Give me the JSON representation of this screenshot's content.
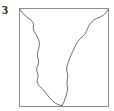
{
  "panel": {
    "label": "3",
    "label_icon": "panel-number-label",
    "background_color": "#ffffff"
  },
  "frame": {
    "name": "plot-frame-rectangle",
    "stroke_color": "#8c8c8c",
    "stroke_width": 1,
    "x": 19.5,
    "y": 8.5,
    "width": 89,
    "height": 98
  },
  "contour": {
    "name": "traced-outline-shape",
    "description": "hand-traced closed contour spanning the frame, open at the top edge, tapering to a rounded point near bottom-center",
    "stroke_color": "#6e6e6e",
    "stroke_width": 1,
    "fill": "none",
    "left_branch_path": "M 19.8 9.2 L 22.5 13.0 L 25.5 16.0 L 28.6 18.2 L 31.2 20.2 L 33.0 22.4 L 33.6 24.8 L 33.2 27.6 L 33.8 30.6 L 35.4 33.6 L 37.2 36.6 L 38.6 39.8 L 39.4 43.2 L 39.2 46.4 L 38.4 49.4 L 37.6 52.4 L 37.4 55.4 L 38.0 58.2 L 38.6 61.0 L 38.4 63.8 L 37.4 66.4 L 36.6 69.0 L 36.8 71.6 L 37.8 74.0 L 38.2 76.4 L 37.6 78.8 L 37.0 81.2 L 37.6 83.6 L 39.2 85.8 L 41.4 88.0 L 43.6 90.2 L 45.6 92.6 L 47.6 95.2 L 49.8 98.0 L 52.4 100.8 L 55.4 103.2 L 58.8 104.9 L 62.2 105.6",
    "right_branch_path": "M 108.4 9.2 L 106.2 12.6 L 103.4 15.2 L 100.2 17.0 L 96.8 18.4 L 93.6 20.2 L 91.0 22.6 L 89.0 25.4 L 87.6 28.4 L 86.4 31.4 L 84.8 34.2 L 82.6 36.6 L 80.2 38.8 L 78.0 41.2 L 76.2 44.0 L 74.8 47.0 L 73.4 50.0 L 72.0 53.0 L 70.6 56.0 L 69.4 59.0 L 68.4 62.0 L 67.4 65.0 L 66.6 68.0 L 66.8 71.0 L 67.6 73.8 L 67.8 76.6 L 67.4 79.4 L 67.0 82.2 L 67.2 85.0 L 67.6 87.8 L 67.4 90.6 L 66.8 93.4 L 66.0 96.2 L 65.0 99.0 L 64.0 101.8 L 62.8 104.2 L 62.2 105.6"
  }
}
